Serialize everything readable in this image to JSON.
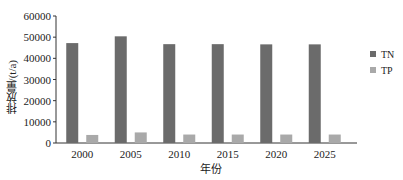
{
  "chart_data": {
    "type": "bar",
    "title": "",
    "xlabel": "年份",
    "ylabel": "排放量/(t/a)",
    "categories": [
      "2000",
      "2005",
      "2010",
      "2015",
      "2020",
      "2025"
    ],
    "series": [
      {
        "name": "TN",
        "color": "#6b6b6b",
        "values": [
          47200,
          50400,
          46700,
          46700,
          46600,
          46600
        ]
      },
      {
        "name": "TP",
        "color": "#a9a9a9",
        "values": [
          3800,
          5000,
          4000,
          4000,
          4000,
          4000
        ]
      }
    ],
    "ylim": [
      0,
      60000
    ],
    "yticks": [
      0,
      10000,
      20000,
      30000,
      40000,
      50000,
      60000
    ],
    "grid": false,
    "legend_position": "right"
  }
}
